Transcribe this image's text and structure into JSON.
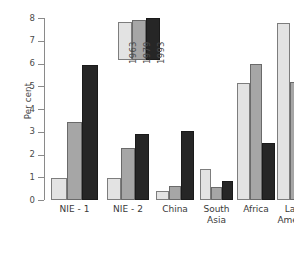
{
  "chart_data": {
    "type": "bar",
    "title": "",
    "subtitle": "",
    "xlabel": "",
    "ylabel": "Per cent",
    "ylim": [
      0,
      8
    ],
    "ytick_labels": [
      "0",
      "1",
      "2",
      "3",
      "4",
      "5",
      "6",
      "7",
      "8"
    ],
    "ytick_values": [
      0,
      1,
      2,
      3,
      4,
      5,
      6,
      7,
      8
    ],
    "grid": false,
    "legend_position": "inside-top-center",
    "categories": [
      "NIE - 1",
      "NIE - 2",
      "China",
      "South\nAsia",
      "Africa",
      "Latin\nAmerica"
    ],
    "series": [
      {
        "name": "1963",
        "color": "#e3e3e3",
        "values": [
          0.95,
          0.97,
          0.38,
          1.37,
          5.15,
          7.78
        ]
      },
      {
        "name": "1979",
        "color": "#a6a6a6",
        "values": [
          3.45,
          2.3,
          0.62,
          0.58,
          5.97,
          5.17
        ]
      },
      {
        "name": "1993",
        "color": "#262626",
        "values": [
          5.95,
          2.92,
          3.05,
          0.82,
          2.5,
          4.83
        ]
      }
    ],
    "legend_entries": [
      "1963",
      "1979",
      "1993"
    ],
    "legend_sample_heights": [
      7.32,
      7.64,
      8.05
    ],
    "axis_color": "#8a8a8a",
    "text_color": "#3a3a3a",
    "background_color": "#ffffff"
  }
}
